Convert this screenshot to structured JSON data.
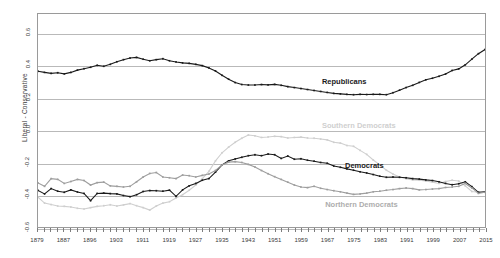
{
  "chart_data": {
    "type": "line",
    "title": "",
    "xlabel": "",
    "ylabel": "Liberal - Conservative",
    "xlim": [
      1879,
      2015
    ],
    "ylim": [
      -0.6,
      0.72
    ],
    "grid": true,
    "grid_axis": "y",
    "legend_position": "in-plot-annotations",
    "y_ticks": [
      "0.6",
      "0.4",
      "0.2",
      "0.0",
      "-0.2",
      "-0.4",
      "-0.6"
    ],
    "y_tick_values": [
      0.6,
      0.4,
      0.2,
      0.0,
      -0.2,
      -0.4,
      -0.6
    ],
    "x_ticks": [
      "1879",
      "1887",
      "1896",
      "1903",
      "1911",
      "1919",
      "1927",
      "1935",
      "1943",
      "1951",
      "1959",
      "1967",
      "1975",
      "1983",
      "1991",
      "1999",
      "2007",
      "2015"
    ],
    "x_tick_values": [
      1879,
      1887,
      1895,
      1903,
      1911,
      1919,
      1927,
      1935,
      1943,
      1951,
      1959,
      1967,
      1975,
      1983,
      1991,
      1999,
      2007,
      2015
    ],
    "x_minor_step": 2,
    "annotations": [
      {
        "name": "Republicans",
        "x": 1965,
        "y": 0.3,
        "color": "#1a1a1a"
      },
      {
        "name": "Southern Democrats",
        "x": 1965,
        "y": 0.035,
        "color": "#cfcfcf"
      },
      {
        "name": "Democrats",
        "x": 1972,
        "y": -0.215,
        "color": "#1a1a1a"
      },
      {
        "name": "Northern Democrats",
        "x": 1966,
        "y": -0.455,
        "color": "#adadad"
      }
    ],
    "series": [
      {
        "name": "Republicans",
        "color": "#1a1a1a",
        "marker": "square",
        "x": [
          1879,
          1881,
          1883,
          1885,
          1887,
          1889,
          1891,
          1893,
          1895,
          1897,
          1899,
          1901,
          1903,
          1905,
          1907,
          1909,
          1911,
          1913,
          1915,
          1917,
          1919,
          1921,
          1923,
          1925,
          1927,
          1929,
          1931,
          1933,
          1935,
          1937,
          1939,
          1941,
          1943,
          1945,
          1947,
          1949,
          1951,
          1953,
          1955,
          1957,
          1959,
          1961,
          1963,
          1965,
          1967,
          1969,
          1971,
          1973,
          1975,
          1977,
          1979,
          1981,
          1983,
          1985,
          1987,
          1989,
          1991,
          1993,
          1995,
          1997,
          1999,
          2001,
          2003,
          2005,
          2007,
          2009,
          2011,
          2013,
          2015
        ],
        "y": [
          0.365,
          0.358,
          0.352,
          0.356,
          0.349,
          0.358,
          0.372,
          0.381,
          0.39,
          0.402,
          0.396,
          0.408,
          0.424,
          0.437,
          0.447,
          0.451,
          0.44,
          0.43,
          0.437,
          0.443,
          0.43,
          0.423,
          0.417,
          0.414,
          0.408,
          0.4,
          0.386,
          0.367,
          0.34,
          0.316,
          0.295,
          0.283,
          0.28,
          0.28,
          0.283,
          0.281,
          0.284,
          0.278,
          0.27,
          0.264,
          0.258,
          0.252,
          0.246,
          0.24,
          0.234,
          0.228,
          0.225,
          0.222,
          0.22,
          0.222,
          0.221,
          0.222,
          0.222,
          0.22,
          0.232,
          0.248,
          0.264,
          0.278,
          0.296,
          0.312,
          0.322,
          0.334,
          0.348,
          0.37,
          0.38,
          0.405,
          0.44,
          0.474,
          0.5
        ]
      },
      {
        "name": "Southern Democrats",
        "color": "#cfcfcf",
        "marker": "square",
        "x": [
          1879,
          1881,
          1883,
          1885,
          1887,
          1889,
          1891,
          1893,
          1895,
          1897,
          1899,
          1901,
          1903,
          1905,
          1907,
          1909,
          1911,
          1913,
          1915,
          1917,
          1919,
          1921,
          1923,
          1925,
          1927,
          1929,
          1931,
          1933,
          1935,
          1937,
          1939,
          1941,
          1943,
          1945,
          1947,
          1949,
          1951,
          1953,
          1955,
          1957,
          1959,
          1961,
          1963,
          1965,
          1967,
          1969,
          1971,
          1973,
          1975,
          1977,
          1979,
          1981,
          1983,
          1985,
          1987,
          1989,
          1991,
          1993,
          1995,
          1997,
          1999,
          2001,
          2003,
          2005,
          2007,
          2009,
          2011,
          2013,
          2015
        ],
        "y": [
          -0.415,
          -0.452,
          -0.461,
          -0.47,
          -0.472,
          -0.476,
          -0.484,
          -0.488,
          -0.48,
          -0.472,
          -0.468,
          -0.462,
          -0.47,
          -0.463,
          -0.455,
          -0.468,
          -0.48,
          -0.495,
          -0.47,
          -0.452,
          -0.443,
          -0.42,
          -0.4,
          -0.372,
          -0.34,
          -0.3,
          -0.255,
          -0.19,
          -0.14,
          -0.105,
          -0.075,
          -0.05,
          -0.03,
          -0.035,
          -0.045,
          -0.042,
          -0.038,
          -0.04,
          -0.048,
          -0.045,
          -0.043,
          -0.048,
          -0.05,
          -0.055,
          -0.06,
          -0.075,
          -0.08,
          -0.095,
          -0.1,
          -0.125,
          -0.15,
          -0.185,
          -0.215,
          -0.248,
          -0.272,
          -0.29,
          -0.3,
          -0.308,
          -0.31,
          -0.315,
          -0.322,
          -0.33,
          -0.318,
          -0.31,
          -0.315,
          -0.345,
          -0.38,
          -0.385,
          -0.383
        ]
      },
      {
        "name": "Democrats",
        "color": "#1a1a1a",
        "marker": "square",
        "x": [
          1879,
          1881,
          1883,
          1885,
          1887,
          1889,
          1891,
          1893,
          1895,
          1897,
          1899,
          1901,
          1903,
          1905,
          1907,
          1909,
          1911,
          1913,
          1915,
          1917,
          1919,
          1921,
          1923,
          1925,
          1927,
          1929,
          1931,
          1933,
          1935,
          1937,
          1939,
          1941,
          1943,
          1945,
          1947,
          1949,
          1951,
          1953,
          1955,
          1957,
          1959,
          1961,
          1963,
          1965,
          1967,
          1969,
          1971,
          1973,
          1975,
          1977,
          1979,
          1981,
          1983,
          1985,
          1987,
          1989,
          1991,
          1993,
          1995,
          1997,
          1999,
          2001,
          2003,
          2005,
          2007,
          2009,
          2011,
          2013,
          2015
        ],
        "y": [
          -0.373,
          -0.395,
          -0.362,
          -0.378,
          -0.385,
          -0.37,
          -0.383,
          -0.392,
          -0.437,
          -0.392,
          -0.39,
          -0.393,
          -0.395,
          -0.405,
          -0.412,
          -0.4,
          -0.38,
          -0.374,
          -0.375,
          -0.378,
          -0.372,
          -0.41,
          -0.37,
          -0.345,
          -0.33,
          -0.31,
          -0.3,
          -0.26,
          -0.215,
          -0.19,
          -0.178,
          -0.168,
          -0.158,
          -0.152,
          -0.158,
          -0.148,
          -0.152,
          -0.175,
          -0.16,
          -0.18,
          -0.177,
          -0.186,
          -0.192,
          -0.2,
          -0.205,
          -0.222,
          -0.23,
          -0.24,
          -0.248,
          -0.258,
          -0.265,
          -0.275,
          -0.285,
          -0.292,
          -0.29,
          -0.292,
          -0.295,
          -0.3,
          -0.303,
          -0.308,
          -0.312,
          -0.32,
          -0.33,
          -0.338,
          -0.332,
          -0.32,
          -0.35,
          -0.385,
          -0.382
        ]
      },
      {
        "name": "Northern Democrats",
        "color": "#9e9e9e",
        "marker": "square",
        "x": [
          1879,
          1881,
          1883,
          1885,
          1887,
          1889,
          1891,
          1893,
          1895,
          1897,
          1899,
          1901,
          1903,
          1905,
          1907,
          1909,
          1911,
          1913,
          1915,
          1917,
          1919,
          1921,
          1923,
          1925,
          1927,
          1929,
          1931,
          1933,
          1935,
          1937,
          1939,
          1941,
          1943,
          1945,
          1947,
          1949,
          1951,
          1953,
          1955,
          1957,
          1959,
          1961,
          1963,
          1965,
          1967,
          1969,
          1971,
          1973,
          1975,
          1977,
          1979,
          1981,
          1983,
          1985,
          1987,
          1989,
          1991,
          1993,
          1995,
          1997,
          1999,
          2001,
          2003,
          2005,
          2007,
          2009,
          2011,
          2013,
          2015
        ],
        "y": [
          -0.327,
          -0.348,
          -0.3,
          -0.305,
          -0.33,
          -0.318,
          -0.305,
          -0.312,
          -0.34,
          -0.325,
          -0.322,
          -0.345,
          -0.348,
          -0.352,
          -0.348,
          -0.32,
          -0.29,
          -0.268,
          -0.262,
          -0.29,
          -0.295,
          -0.3,
          -0.278,
          -0.282,
          -0.29,
          -0.28,
          -0.272,
          -0.25,
          -0.215,
          -0.198,
          -0.195,
          -0.2,
          -0.212,
          -0.228,
          -0.25,
          -0.27,
          -0.288,
          -0.305,
          -0.322,
          -0.34,
          -0.352,
          -0.356,
          -0.348,
          -0.36,
          -0.368,
          -0.375,
          -0.382,
          -0.39,
          -0.398,
          -0.395,
          -0.39,
          -0.382,
          -0.378,
          -0.372,
          -0.368,
          -0.362,
          -0.358,
          -0.362,
          -0.37,
          -0.368,
          -0.365,
          -0.362,
          -0.355,
          -0.352,
          -0.348,
          -0.33,
          -0.358,
          -0.392,
          -0.385
        ]
      }
    ]
  }
}
